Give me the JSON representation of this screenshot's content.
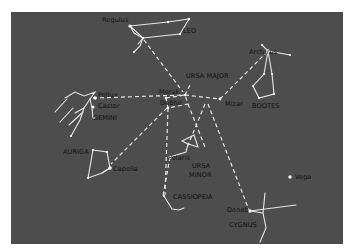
{
  "diagram": {
    "colors": {
      "background": "#4d4d4d",
      "lines": "#e8e8e8",
      "stars": "#f2f2f2",
      "labels": "#111111"
    },
    "labels": {
      "regulus": "Regulus",
      "leo": "LEO",
      "ursa_major": "URSA MAJOR",
      "arcturus": "Arcturus",
      "merak": "Merak",
      "dubhe": "Dubhe",
      "mizar": "Mizar",
      "bootes": "BOOTES",
      "pollux": "Pollux",
      "castor": "Castor",
      "gemini": "GEMINI",
      "auriga": "AURIGA",
      "capella": "Capella",
      "polaris": "Polaris",
      "ursa_minor_1": "URSA",
      "ursa_minor_2": "MINOR",
      "cassiopeia": "CASSIOPEIA",
      "vega": "Vega",
      "deneb": "Deneb",
      "cygnus": "CYGNUS"
    },
    "constellations": [
      "LEO",
      "URSA MAJOR",
      "BOOTES",
      "GEMINI",
      "AURIGA",
      "URSA MINOR",
      "CASSIOPEIA",
      "CYGNUS"
    ],
    "stars": [
      "Regulus",
      "Arcturus",
      "Merak",
      "Dubhe",
      "Mizar",
      "Pollux",
      "Castor",
      "Capella",
      "Polaris",
      "Vega",
      "Deneb"
    ]
  }
}
